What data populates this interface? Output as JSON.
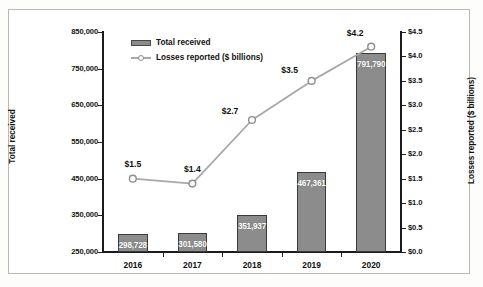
{
  "chart_data": {
    "type": "bar",
    "title": "",
    "subtitle": "",
    "categories": [
      "2016",
      "2017",
      "2018",
      "2019",
      "2020"
    ],
    "xlabel": "",
    "ylabel": "Total received",
    "y2label": "Losses reported ($ billions)",
    "ylim": [
      250000,
      850000
    ],
    "y2lim": [
      0.0,
      4.5
    ],
    "grid": false,
    "legend_position": "top-left-inside",
    "series": [
      {
        "name": "Total received",
        "type": "bar",
        "axis": "left",
        "color": "#8c8c8c",
        "values": [
          298728,
          301580,
          351937,
          467361,
          791790
        ],
        "data_labels": [
          "298,728",
          "301,580",
          "351,937",
          "467,361",
          "791,790"
        ]
      },
      {
        "name": "Losses reported ($ billions)",
        "type": "line",
        "axis": "right",
        "color": "#a8a8a8",
        "marker": "circle",
        "values": [
          1.5,
          1.4,
          2.7,
          3.5,
          4.2
        ],
        "data_labels": [
          "$1.5",
          "$1.4",
          "$2.7",
          "$3.5",
          "$4.2"
        ]
      }
    ],
    "left_axis_ticks": [
      "850,000",
      "750,000",
      "650,000",
      "550,000",
      "450,000",
      "350,000",
      "250,000"
    ],
    "right_axis_ticks": [
      "$4.5",
      "$4.0",
      "$3.5",
      "$3.0",
      "$2.5",
      "$2.0",
      "$1.5",
      "$1.0",
      "$0.5",
      "$0.0"
    ],
    "left_axis_tick_values": [
      850000,
      750000,
      650000,
      550000,
      450000,
      350000,
      250000
    ],
    "right_axis_tick_values": [
      4.5,
      4.0,
      3.5,
      3.0,
      2.5,
      2.0,
      1.5,
      1.0,
      0.5,
      0.0
    ]
  },
  "legend": {
    "entries": [
      {
        "label": "Total received",
        "marker": "bar-swatch"
      },
      {
        "label": "Losses reported ($ billions)",
        "marker": "line-circle-swatch"
      }
    ]
  },
  "colors": {
    "bar_fill": "#8c8c8c",
    "bar_stroke": "#3a3a3a",
    "line": "#a8a8a8",
    "marker_fill": "#fbfbfb",
    "axis": "#1b1b1b",
    "text": "#111111",
    "bar_label_text": "#ffffff",
    "frame_border": "#b9b9b9",
    "plot_background": "#ffffff"
  }
}
